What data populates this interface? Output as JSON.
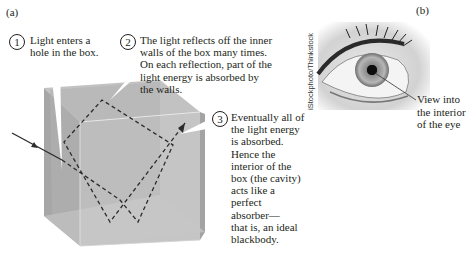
{
  "panels": {
    "a": {
      "label": "(a)",
      "callouts": [
        {
          "number": "1",
          "text": "Light enters a\nhole in the box."
        },
        {
          "number": "2",
          "text": "The light reflects off the inner\nwalls of the box many times.\nOn each reflection, part of the\nlight energy is absorbed by\nthe walls."
        },
        {
          "number": "3",
          "text": "Eventually all of\nthe light energy\nis absorbed.\nHence the\ninterior of the\nbox (the cavity)\nacts like a\nperfect\nabsorber—\nthat is, an ideal\nblackbody."
        }
      ]
    },
    "b": {
      "label": "(b)",
      "photo_credit": "iStockphoto/Thinkstock",
      "annotation": "View into\nthe interior\nof the eye"
    }
  },
  "colors": {
    "box_front": "#b9b9b9",
    "box_side": "#a9a9a9",
    "box_top": "#c4c4c4",
    "box_inner": "#9f9f9f",
    "light_path": "#2b2b2b",
    "text": "#231f20"
  }
}
